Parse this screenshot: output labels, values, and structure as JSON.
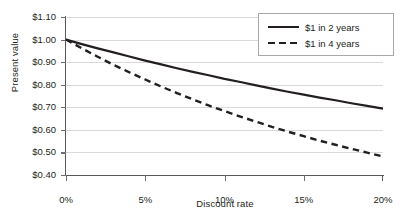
{
  "chart_data": {
    "type": "line",
    "title": "",
    "xlabel": "Discount rate",
    "ylabel": "Present value",
    "xlim": [
      0,
      20
    ],
    "ylim": [
      0.4,
      1.1
    ],
    "grid": true,
    "legend_position": "top-right",
    "x_tick_labels": [
      "0%",
      "5%",
      "10%",
      "15%",
      "20%"
    ],
    "x_tick_values": [
      0,
      5,
      10,
      15,
      20
    ],
    "y_tick_labels": [
      "$0.40",
      "$0.50",
      "$0.60",
      "$0.70",
      "$0.80",
      "$0.90",
      "$1.00",
      "$1.10"
    ],
    "y_tick_values": [
      0.4,
      0.5,
      0.6,
      0.7,
      0.8,
      0.9,
      1.0,
      1.1
    ],
    "x": [
      0,
      1,
      2,
      3,
      4,
      5,
      6,
      7,
      8,
      9,
      10,
      11,
      12,
      13,
      14,
      15,
      16,
      17,
      18,
      19,
      20
    ],
    "series": [
      {
        "name": "$1 in 2 years",
        "style": "solid",
        "color": "#231f20",
        "values": [
          1.0,
          0.98,
          0.961,
          0.943,
          0.925,
          0.907,
          0.89,
          0.873,
          0.857,
          0.842,
          0.826,
          0.812,
          0.797,
          0.783,
          0.769,
          0.756,
          0.743,
          0.731,
          0.718,
          0.706,
          0.694
        ]
      },
      {
        "name": "$1 in 4 years",
        "style": "dashed",
        "color": "#231f20",
        "values": [
          1.0,
          0.961,
          0.924,
          0.888,
          0.855,
          0.823,
          0.792,
          0.763,
          0.735,
          0.708,
          0.683,
          0.659,
          0.636,
          0.613,
          0.592,
          0.572,
          0.552,
          0.534,
          0.516,
          0.499,
          0.482
        ]
      }
    ]
  },
  "axes": {
    "y_title": "Present value",
    "x_title": "Discount rate"
  },
  "legend": {
    "entries": [
      {
        "label": "$1 in 2 years",
        "style": "solid"
      },
      {
        "label": "$1 in 4 years",
        "style": "dashed"
      }
    ]
  }
}
